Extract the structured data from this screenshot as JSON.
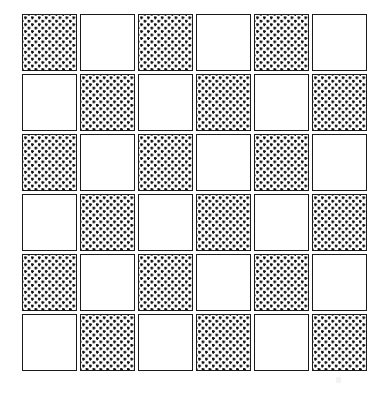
{
  "figure": {
    "background_color": "#ffffff",
    "canvas": {
      "width": 373,
      "height": 394
    }
  },
  "board": {
    "rows": 6,
    "columns": 6,
    "origin_x": 22,
    "origin_y": 14,
    "cell_width": 55,
    "cell_height": 57,
    "cell_gap_x": 3,
    "cell_gap_y": 3,
    "border_color": "#1a1a1a",
    "border_width": 1,
    "fill_color": "#ffffff",
    "dot_color": "#111111",
    "dot_size": 2.7,
    "dot_spacing": 6.9,
    "dot_pattern": "staggered-grid",
    "first_cell_state": "dotted",
    "states": [
      "dotted",
      "plain"
    ],
    "cells": [
      [
        "dotted",
        "plain",
        "dotted",
        "plain",
        "dotted",
        "plain"
      ],
      [
        "plain",
        "dotted",
        "plain",
        "dotted",
        "plain",
        "dotted"
      ],
      [
        "dotted",
        "plain",
        "dotted",
        "plain",
        "dotted",
        "plain"
      ],
      [
        "plain",
        "dotted",
        "plain",
        "dotted",
        "plain",
        "dotted"
      ],
      [
        "dotted",
        "plain",
        "dotted",
        "plain",
        "dotted",
        "plain"
      ],
      [
        "plain",
        "dotted",
        "plain",
        "dotted",
        "plain",
        "dotted"
      ]
    ]
  },
  "artifact": {
    "present": true,
    "x": 336,
    "y": 377,
    "width": 5,
    "height": 6,
    "color": "#f3f3f3"
  }
}
